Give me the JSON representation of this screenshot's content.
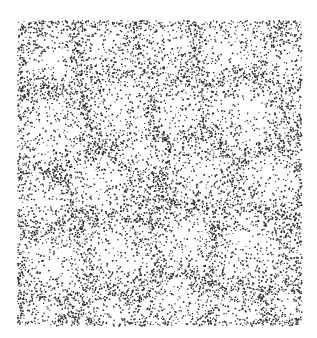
{
  "image": {
    "description": "Stippled ink illustration of packed rounded cell-like shapes; dots denser at cell borders",
    "width": 317,
    "height": 338,
    "background": "#ffffff",
    "dot_color": "#2a2a2a",
    "frame": {
      "x": 17,
      "y": 20,
      "width": 284,
      "height": 305
    },
    "cells": [
      [
        45,
        55,
        32
      ],
      [
        105,
        40,
        30
      ],
      [
        165,
        45,
        28
      ],
      [
        230,
        45,
        34
      ],
      [
        285,
        60,
        22
      ],
      [
        50,
        130,
        38
      ],
      [
        120,
        110,
        32
      ],
      [
        175,
        110,
        26
      ],
      [
        245,
        115,
        38
      ],
      [
        40,
        200,
        30
      ],
      [
        95,
        185,
        30
      ],
      [
        140,
        150,
        22
      ],
      [
        200,
        170,
        30
      ],
      [
        270,
        180,
        30
      ],
      [
        55,
        265,
        34
      ],
      [
        120,
        250,
        36
      ],
      [
        185,
        240,
        30
      ],
      [
        250,
        245,
        36
      ],
      [
        40,
        315,
        20
      ],
      [
        110,
        315,
        22
      ],
      [
        175,
        305,
        26
      ],
      [
        235,
        310,
        22
      ],
      [
        290,
        305,
        18
      ]
    ],
    "dot_count": 9000,
    "seed": 7
  }
}
